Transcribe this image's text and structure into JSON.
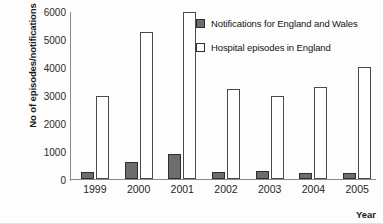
{
  "chart_data": {
    "type": "bar",
    "title": "",
    "subtitle": "",
    "xlabel": "Year",
    "ylabel": "No of episodes/notifications",
    "categories": [
      "1999",
      "2000",
      "2001",
      "2002",
      "2003",
      "2004",
      "2005"
    ],
    "series": [
      {
        "name": "Notifications for England and Wales",
        "color": "#6d6d6d",
        "values": [
          250,
          620,
          900,
          260,
          270,
          200,
          220
        ]
      },
      {
        "name": "Hospital episodes in England",
        "color": "#ffffff",
        "values": [
          2950,
          5250,
          5950,
          3200,
          2950,
          3300,
          4000
        ]
      }
    ],
    "ylim": [
      0,
      6000
    ],
    "yticks": [
      0,
      1000,
      2000,
      3000,
      4000,
      5000,
      6000
    ],
    "ytick_labels": [
      "0",
      "1000",
      "2000",
      "3000",
      "4000",
      "5000",
      "6000"
    ],
    "grid": false,
    "legend_position": "top-right-inside"
  },
  "legend": {
    "entries": [
      {
        "label": "Notifications for England and Wales",
        "swatch": "dark"
      },
      {
        "label": "Hospital episodes in England",
        "swatch": "light"
      }
    ]
  },
  "axes": {
    "y_title": "No of episodes/notifications",
    "x_title": "Year"
  }
}
